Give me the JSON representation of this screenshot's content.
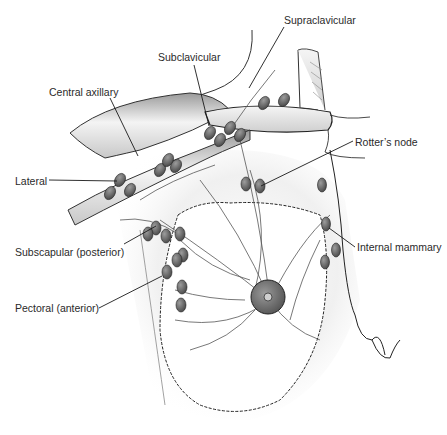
{
  "diagram": {
    "labels": [
      {
        "id": "supraclavicular",
        "text": "Supraclavicular",
        "x": 284,
        "y": 14
      },
      {
        "id": "subclavicular",
        "text": "Subclavicular",
        "x": 158,
        "y": 51
      },
      {
        "id": "central-axillary",
        "text": "Central axillary",
        "x": 49,
        "y": 86
      },
      {
        "id": "lateral",
        "text": "Lateral",
        "x": 15,
        "y": 175
      },
      {
        "id": "rotters-node",
        "text": "Rotter’s node",
        "x": 355,
        "y": 136
      },
      {
        "id": "subscapular-posterior",
        "text": "Subscapular (posterior)",
        "x": 15,
        "y": 246
      },
      {
        "id": "internal-mammary",
        "text": "Internal mammary",
        "x": 357,
        "y": 241
      },
      {
        "id": "pectoral-anterior",
        "text": "Pectoral (anterior)",
        "x": 15,
        "y": 302
      }
    ],
    "colors": {
      "line": "#1a1a1a",
      "node_fill": "#6a6a6a",
      "node_stroke": "#2a2a2a",
      "skin_shade": "#d8d8d8",
      "areola": "#7a7a7a",
      "background": "#ffffff"
    }
  }
}
